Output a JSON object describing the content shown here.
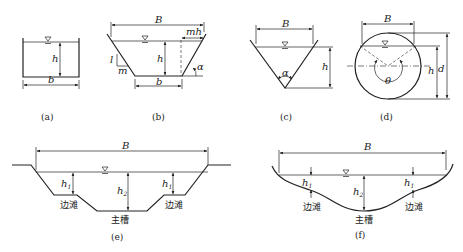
{
  "figure": {
    "panels": [
      {
        "id": "a",
        "caption": "(a)",
        "shape": "rectangular",
        "labels": {
          "width": "b",
          "depth": "h"
        }
      },
      {
        "id": "b",
        "caption": "(b)",
        "shape": "trapezoidal",
        "labels": {
          "top_width": "B",
          "bottom_width": "b",
          "depth": "h",
          "slope_horizontal": "mh",
          "slope_vertical": "l",
          "slope_run": "m",
          "angle": "α"
        }
      },
      {
        "id": "c",
        "caption": "(c)",
        "shape": "triangular",
        "labels": {
          "top_width": "B",
          "depth": "h",
          "angle": "α"
        }
      },
      {
        "id": "d",
        "caption": "(d)",
        "shape": "circular",
        "labels": {
          "top_width": "B",
          "depth": "h",
          "diameter": "d",
          "angle": "θ"
        }
      },
      {
        "id": "e",
        "caption": "(e)",
        "shape": "compound-trapezoidal",
        "labels": {
          "top_width": "B",
          "floodplain_depth": "h",
          "floodplain_sub": "1",
          "main_depth": "h",
          "main_sub": "2",
          "floodplain_left": "边滩",
          "floodplain_right": "边滩",
          "main_channel": "主槽"
        }
      },
      {
        "id": "f",
        "caption": "(f)",
        "shape": "natural-compound",
        "labels": {
          "top_width": "B",
          "floodplain_depth": "h",
          "floodplain_sub": "1",
          "main_depth": "h",
          "main_sub": "2",
          "floodplain_left": "边滩",
          "floodplain_right": "边滩",
          "main_channel": "主槽"
        }
      }
    ]
  }
}
